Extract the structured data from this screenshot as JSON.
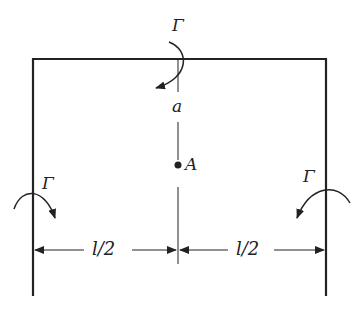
{
  "diagram": {
    "labels": {
      "moment_top": "Γ",
      "moment_left": "Γ",
      "moment_right": "Γ",
      "distance": "a",
      "point": "A",
      "half_span_left": "l/2",
      "half_span_right": "l/2"
    },
    "colors": {
      "stroke": "#222222",
      "background": "#ffffff"
    }
  }
}
